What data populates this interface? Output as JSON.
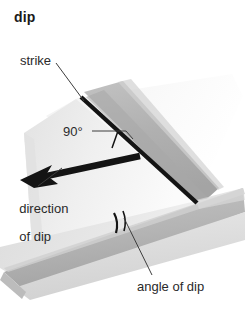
{
  "figure": {
    "title": "dip",
    "type": "geological-block-diagram",
    "background_color": "#ffffff",
    "labels": [
      {
        "id": "strike",
        "text": "strike",
        "x": 20,
        "y": 54
      },
      {
        "id": "ninety",
        "text": "90°",
        "x": 63,
        "y": 125
      },
      {
        "id": "direction",
        "text": "direction",
        "x": 12,
        "y": 188
      },
      {
        "id": "of-dip",
        "text": "of dip",
        "x": 12,
        "y": 202
      },
      {
        "id": "angle-of-dip",
        "text": "angle of dip",
        "x": 137,
        "y": 280
      }
    ],
    "colors": {
      "ink": "#2a2a2a",
      "title_ink": "#1a1a1a",
      "heavy_line": "#161616",
      "leader_line": "#4a4a4a",
      "plane_top_light": "#ededed",
      "plane_top_pale": "#f4f4f4",
      "band_gray": "#b2b2b2",
      "band_gray_dark": "#9a9a9a",
      "bed_top": "#e2e2e2",
      "bed_face": "#bdbdbd",
      "bed_face_dark": "#a7a7a7",
      "shadow_gray": "#d6d6d6"
    },
    "elements": {
      "strike_line": "thick black line running down-right along the inclined bedding plane",
      "dip_arrow": "thick black barbed arrow pointing down-left, perpendicular to strike",
      "right_angle_marker": "small square corner mark at the strike/dip junction",
      "angle_arc": "short black arc across the lower bed face marking the dip angle"
    }
  }
}
